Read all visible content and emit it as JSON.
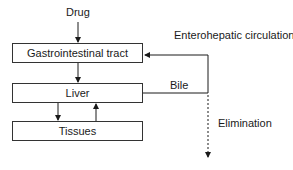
{
  "diagram": {
    "input_label": "Drug",
    "boxes": [
      {
        "id": "gi",
        "label": "Gastrointestinal tract"
      },
      {
        "id": "liver",
        "label": "Liver"
      },
      {
        "id": "tissues",
        "label": "Tissues"
      }
    ],
    "edge_labels": {
      "enterohepatic": "Enterohepatic circulation",
      "bile": "Bile",
      "elimination": "Elimination"
    }
  }
}
